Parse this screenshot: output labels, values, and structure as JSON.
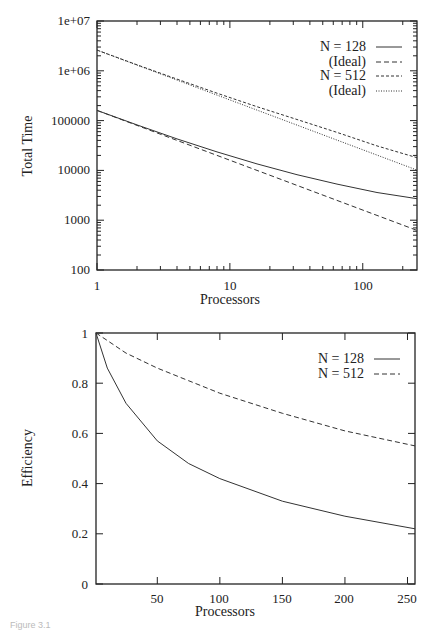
{
  "chart_data": [
    {
      "type": "line",
      "title": "",
      "xlabel": "Processors",
      "ylabel": "Total Time",
      "xscale": "log",
      "yscale": "log",
      "xlim": [
        1,
        256
      ],
      "ylim": [
        100,
        10000000
      ],
      "x_ticks": [
        "1",
        "10",
        "100"
      ],
      "y_ticks": [
        "100",
        "1000",
        "10000",
        "100000",
        "1e+06",
        "1e+07"
      ],
      "grid": false,
      "legend_position": "upper right",
      "x": [
        1,
        2,
        4,
        8,
        16,
        32,
        64,
        128,
        256
      ],
      "series": [
        {
          "name": "N = 128",
          "style": "solid",
          "values": [
            160000,
            82000,
            43000,
            23500,
            13500,
            8200,
            5300,
            3600,
            2700
          ]
        },
        {
          "name": "(Ideal)",
          "style": "dashed",
          "values": [
            160000,
            80000,
            40000,
            20000,
            10000,
            5000,
            2500,
            1250,
            625
          ]
        },
        {
          "name": "N = 512",
          "style": "short-dashed",
          "values": [
            2600000,
            1320000,
            680000,
            355000,
            190000,
            105000,
            58000,
            31000,
            18000
          ]
        },
        {
          "name": "(Ideal)",
          "style": "dotted",
          "values": [
            2600000,
            1300000,
            650000,
            325000,
            162500,
            81250,
            40600,
            20300,
            10150
          ]
        }
      ]
    },
    {
      "type": "line",
      "title": "",
      "xlabel": "Processors",
      "ylabel": "Efficiency",
      "xlim": [
        1,
        256
      ],
      "ylim": [
        0,
        1
      ],
      "x_ticks": [
        "50",
        "100",
        "150",
        "200",
        "250"
      ],
      "y_ticks": [
        "0",
        "0.2",
        "0.4",
        "0.6",
        "0.8",
        "1"
      ],
      "grid": false,
      "legend_position": "upper right",
      "x": [
        1,
        10,
        25,
        50,
        75,
        100,
        150,
        200,
        256
      ],
      "series": [
        {
          "name": "N = 128",
          "style": "solid",
          "values": [
            1.0,
            0.86,
            0.72,
            0.57,
            0.48,
            0.42,
            0.33,
            0.27,
            0.22
          ]
        },
        {
          "name": "N = 512",
          "style": "dashed",
          "values": [
            1.0,
            0.97,
            0.92,
            0.86,
            0.81,
            0.76,
            0.68,
            0.61,
            0.55
          ]
        }
      ]
    }
  ],
  "top_chart": {
    "ylabel": "Total Time",
    "xlabel": "Processors",
    "y_tick_labels": [
      "1e+07",
      "1e+06",
      "100000",
      "10000",
      "1000",
      "100"
    ],
    "x_tick_labels": [
      "1",
      "10",
      "100"
    ],
    "legend": [
      "N = 128",
      "(Ideal)",
      "N = 512",
      "(Ideal)"
    ]
  },
  "bottom_chart": {
    "ylabel": "Efficiency",
    "xlabel": "Processors",
    "y_tick_labels": [
      "1",
      "0.8",
      "0.6",
      "0.4",
      "0.2",
      "0"
    ],
    "x_tick_labels": [
      "50",
      "100",
      "150",
      "200",
      "250"
    ],
    "legend": [
      "N = 128",
      "N = 512"
    ]
  },
  "caption": "Figure 3.1"
}
